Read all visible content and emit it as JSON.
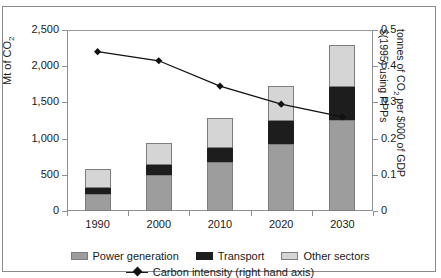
{
  "figure": {
    "title_remnant": "",
    "background": "#ffffff",
    "frame_color": "#8a8a8a"
  },
  "chart_data": {
    "type": "bar",
    "title": "",
    "subtitle": "",
    "categories": [
      "1990",
      "2000",
      "2010",
      "2020",
      "2030"
    ],
    "xlabel": "",
    "ylabel": "Mt of CO2",
    "ylabel_display": "Mt of CO",
    "ylabel_sub": "2",
    "ylim": [
      0,
      2500
    ],
    "yticks": [
      0,
      500,
      1000,
      1500,
      2000,
      2500
    ],
    "ytick_labels": [
      "0",
      "500",
      "1,000",
      "1,500",
      "2,000",
      "2,500"
    ],
    "y2label_lines": [
      "tonnes of CO2 per $000 of GDP",
      "$(1995) using PPPs"
    ],
    "y2label_line1_a": "tonnes of CO",
    "y2label_line1_sub": "2",
    "y2label_line1_b": " per $000 of GDP",
    "y2label_line2": "$(1995) using PPPs",
    "ylim2": [
      0,
      0.5
    ],
    "yticks2": [
      0,
      0.1,
      0.2,
      0.3,
      0.4,
      0.5
    ],
    "ytick_labels2": [
      "0",
      "0.1",
      "0.2",
      "0.3",
      "0.4",
      "0.5"
    ],
    "grid": false,
    "stacked": true,
    "legend_position": "bottom",
    "series": [
      {
        "name": "Power generation",
        "color": "#9d9d9d",
        "axis": "left",
        "kind": "bar",
        "values": [
          230,
          500,
          670,
          920,
          1260
        ]
      },
      {
        "name": "Transport",
        "color": "#1d1d1d",
        "axis": "left",
        "kind": "bar",
        "values": [
          90,
          130,
          200,
          320,
          450
        ]
      },
      {
        "name": "Other sectors",
        "color": "#d5d5d5",
        "axis": "left",
        "kind": "bar",
        "values": [
          260,
          310,
          410,
          490,
          580
        ]
      },
      {
        "name": "Carbon intensity (right hand axis)",
        "color": "#111111",
        "axis": "right",
        "kind": "line",
        "marker": "diamond",
        "values": [
          0.44,
          0.415,
          0.345,
          0.295,
          0.26
        ]
      }
    ],
    "totals": [
      580,
      940,
      1280,
      1730,
      2290
    ]
  },
  "legend": {
    "row1": [
      {
        "label": "Power generation",
        "swatch": "power"
      },
      {
        "label": "Transport",
        "swatch": "transport"
      },
      {
        "label": "Other sectors",
        "swatch": "other"
      }
    ],
    "row2": {
      "label": "Carbon intensity (right hand axis)",
      "marker": "line-diamond-marker"
    }
  }
}
